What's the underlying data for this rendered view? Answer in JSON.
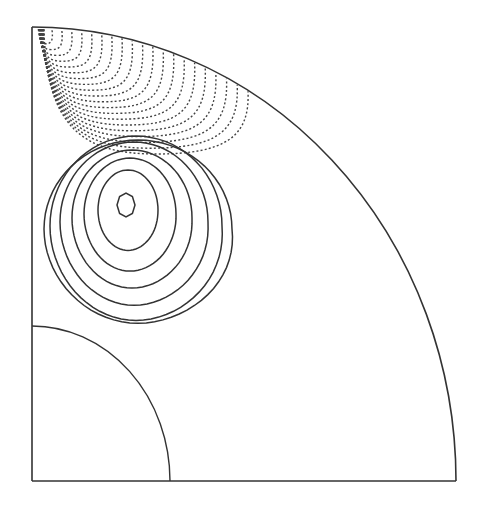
{
  "figure": {
    "type": "contour-plot-quarter-annulus",
    "colors": {
      "background": "#ffffff",
      "line": "#333333",
      "dashed": "#444444"
    },
    "domain": {
      "origin": [
        32,
        481
      ],
      "outer_radius_x": 424,
      "outer_radius_y": 454,
      "inner_radius_x": 138,
      "inner_radius_y": 155
    },
    "solid_contours": {
      "style": "solid",
      "count": 7,
      "center": [
        126,
        205
      ],
      "rings": [
        {
          "cx": 126,
          "cy": 205,
          "rx": 9,
          "ry": 12
        },
        {
          "cx": 128,
          "cy": 210,
          "rx": 30,
          "ry": 40
        },
        {
          "cx": 130,
          "cy": 214,
          "rx": 46,
          "ry": 56
        },
        {
          "cx": 132,
          "cy": 218,
          "rx": 60,
          "ry": 68
        },
        {
          "cx": 134,
          "cy": 222,
          "rx": 74,
          "ry": 80
        },
        {
          "cx": 136,
          "cy": 226,
          "rx": 86,
          "ry": 90
        },
        {
          "cx": 138,
          "cy": 229,
          "rx": 94,
          "ry": 89
        }
      ]
    },
    "dashed_contours": {
      "style": "dashed",
      "count": 20,
      "anchor": [
        32,
        27
      ],
      "outermost_extent": {
        "x_max": 238,
        "y_max": 150
      }
    }
  }
}
